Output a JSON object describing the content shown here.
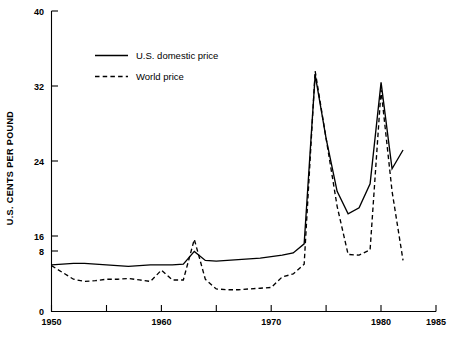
{
  "chart_data": {
    "type": "line",
    "title": "",
    "subtitle": "",
    "xlabel": "",
    "ylabel": "U.S. CENTS PER POUND",
    "xlim": [
      1950,
      1985
    ],
    "ylim": [
      0,
      40
    ],
    "yticks": [
      0,
      8,
      16,
      24,
      32,
      40
    ],
    "ytick_labels": [
      "0",
      "8",
      "16",
      "24",
      "32",
      "40"
    ],
    "xticks": [
      1950,
      1955,
      1960,
      1965,
      1970,
      1975,
      1980,
      1985
    ],
    "xtick_labels": [
      "1950",
      "",
      "1960",
      "",
      "1970",
      "",
      "1980",
      "1985"
    ],
    "xtick_labels_shown": [
      "1950",
      "1960",
      "1970",
      "1980",
      "1985"
    ],
    "grid": false,
    "legend_position": "upper-left-inside",
    "series": [
      {
        "name": "U.S. domestic price",
        "style": "solid",
        "x": [
          1950,
          1951,
          1952,
          1953,
          1954,
          1955,
          1956,
          1957,
          1958,
          1959,
          1960,
          1961,
          1962,
          1963,
          1964,
          1965,
          1966,
          1967,
          1968,
          1969,
          1970,
          1971,
          1972,
          1973,
          1974,
          1975,
          1976,
          1977,
          1978,
          1979,
          1980,
          1981,
          1982
        ],
        "values": [
          6.2,
          6.3,
          6.4,
          6.4,
          6.3,
          6.2,
          6.1,
          6.0,
          6.1,
          6.2,
          6.2,
          6.2,
          6.3,
          8.0,
          6.8,
          6.7,
          6.8,
          6.9,
          7.0,
          7.1,
          7.3,
          7.5,
          7.8,
          9.0,
          31.5,
          23.0,
          16.0,
          13.0,
          13.8,
          17.0,
          30.5,
          19.0,
          21.5
        ]
      },
      {
        "name": "World price",
        "style": "dashed",
        "x": [
          1950,
          1951,
          1952,
          1953,
          1954,
          1955,
          1956,
          1957,
          1958,
          1959,
          1960,
          1961,
          1962,
          1963,
          1964,
          1965,
          1966,
          1967,
          1968,
          1969,
          1970,
          1971,
          1972,
          1973,
          1974,
          1975,
          1976,
          1977,
          1978,
          1979,
          1980,
          1981,
          1982
        ],
        "values": [
          6.1,
          5.2,
          4.3,
          4.0,
          4.1,
          4.3,
          4.3,
          4.4,
          4.2,
          4.0,
          5.5,
          4.2,
          4.2,
          9.6,
          4.3,
          3.0,
          2.9,
          2.9,
          3.0,
          3.1,
          3.2,
          4.6,
          5.0,
          6.3,
          32.0,
          23.0,
          14.0,
          7.6,
          7.5,
          8.2,
          29.5,
          16.0,
          6.8
        ]
      }
    ],
    "legend": [
      {
        "label": "U.S. domestic price",
        "style": "solid"
      },
      {
        "label": "World price",
        "style": "dashed"
      }
    ],
    "annotations": []
  }
}
